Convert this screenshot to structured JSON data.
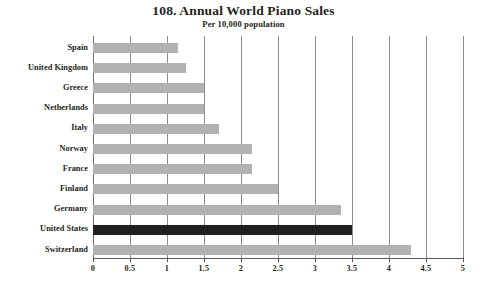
{
  "chart_data": {
    "type": "bar",
    "orientation": "horizontal",
    "title": "108. Annual World Piano Sales",
    "subtitle": "Per 10,000 population",
    "xlabel": "",
    "ylabel": "",
    "xlim": [
      0,
      5
    ],
    "grid": true,
    "legend": "none",
    "highlight_category": "United States",
    "colors": {
      "bar": "#b2b2b2",
      "bar_highlight": "#211f1f",
      "gridline": "#8c8c8c",
      "axis": "#595959",
      "text": "#231f20",
      "background": "#ffffff"
    },
    "categories": [
      "Spain",
      "United Kingdom",
      "Greece",
      "Netherlands",
      "Italy",
      "Norway",
      "France",
      "Finland",
      "Germany",
      "United States",
      "Switzerland"
    ],
    "values": [
      1.15,
      1.25,
      1.5,
      1.5,
      1.7,
      2.15,
      2.15,
      2.5,
      3.35,
      3.5,
      4.3
    ],
    "xticks": [
      0,
      0.5,
      1,
      1.5,
      2,
      2.5,
      3,
      3.5,
      4,
      4.5,
      5
    ],
    "xtick_labels": [
      "0",
      "0.5",
      "1",
      "1.5",
      "2",
      "2.5",
      "3",
      "3.5",
      "4",
      "4.5",
      "5"
    ]
  }
}
